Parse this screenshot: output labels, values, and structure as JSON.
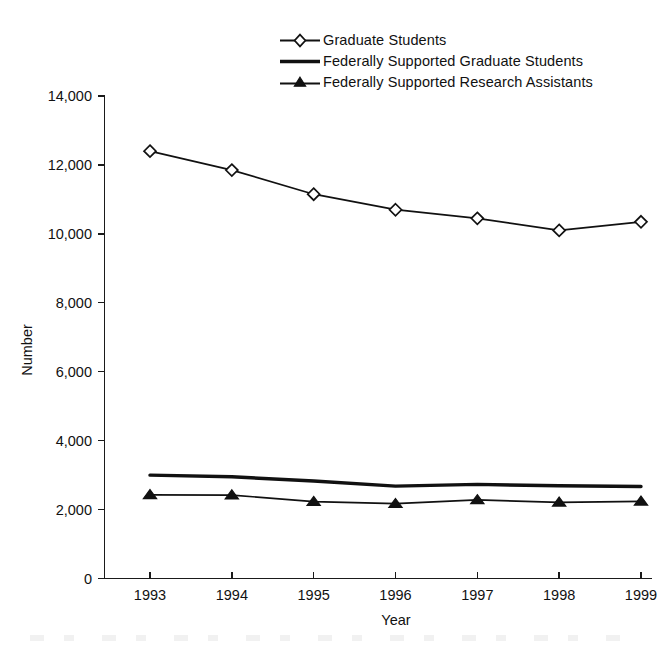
{
  "chart_data": {
    "type": "line",
    "title": "",
    "subtitle": "",
    "xlabel": "Year",
    "ylabel": "Number",
    "categories": [
      "1993",
      "1994",
      "1995",
      "1996",
      "1997",
      "1998",
      "1999"
    ],
    "x": [
      1993,
      1994,
      1995,
      1996,
      1997,
      1998,
      1999
    ],
    "ylim": [
      0,
      14000
    ],
    "xlim": [
      1993,
      1999
    ],
    "yticks": [
      0,
      2000,
      4000,
      6000,
      8000,
      10000,
      12000,
      14000
    ],
    "ytick_labels": [
      "0",
      "2,000",
      "4,000",
      "6,000",
      "8,000",
      "10,000",
      "12,000",
      "14,000"
    ],
    "xticks": [
      1993,
      1994,
      1995,
      1996,
      1997,
      1998,
      1999
    ],
    "xtick_labels": [
      "1993",
      "1994",
      "1995",
      "1996",
      "1997",
      "1998",
      "1999"
    ],
    "grid": false,
    "legend_position": "top-center",
    "series": [
      {
        "name": "Graduate Students",
        "marker": "diamond-open",
        "line_style": "thin",
        "color": "#111111",
        "values": [
          12400,
          11850,
          11150,
          10700,
          10450,
          10100,
          10350
        ]
      },
      {
        "name": "Federally Supported Graduate Students",
        "marker": "none",
        "line_style": "thick",
        "color": "#111111",
        "values": [
          3000,
          2950,
          2830,
          2680,
          2730,
          2690,
          2670
        ]
      },
      {
        "name": "Federally Supported Research Assistants",
        "marker": "triangle-filled",
        "line_style": "thin",
        "color": "#111111",
        "values": [
          2430,
          2420,
          2230,
          2170,
          2280,
          2210,
          2240
        ]
      }
    ]
  },
  "legend": {
    "items": [
      {
        "label": "Graduate Students",
        "key": "diamond-open-line-key"
      },
      {
        "label": "Federally Supported Graduate Students",
        "key": "thick-line-key"
      },
      {
        "label": "Federally Supported Research Assistants",
        "key": "triangle-filled-line-key"
      }
    ]
  },
  "axes": {
    "y_title": "Number",
    "x_title": "Year",
    "y_tick_labels": [
      "14,000",
      "12,000",
      "10,000",
      "8,000",
      "6,000",
      "4,000",
      "2,000",
      "0"
    ],
    "x_tick_labels": [
      "1993",
      "1994",
      "1995",
      "1996",
      "1997",
      "1998",
      "1999"
    ]
  }
}
